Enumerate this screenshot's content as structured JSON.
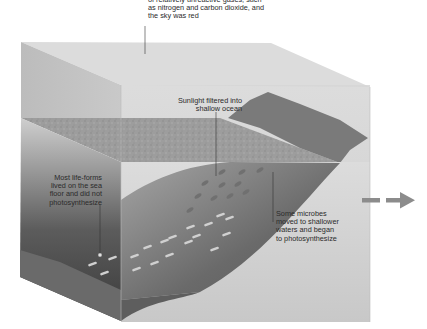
{
  "diagram": {
    "labels": {
      "atmosphere": "of relatively unreactive gases, such\nas nitrogen and carbon dioxide, and\nthe sky was red",
      "atmosphere_cropped_first_line": "Early atmosphere was composed",
      "sunlight": "Sunlight filtered into\nshallow ocean",
      "sea_floor": "Most life-forms\nlived on the sea\nfloor and did not\nphotosynthesize",
      "shallow_microbes": "Some microbes\nmoved to shallower\nwaters and began\nto photosynthesize"
    },
    "regions": [
      {
        "name": "atmosphere",
        "color": "#d9d9d9"
      },
      {
        "name": "water-surface",
        "color": "#9a9a9a"
      },
      {
        "name": "land",
        "color": "#7c7c7c"
      },
      {
        "name": "deep-ocean-left-face",
        "color": "#5e5e5e"
      },
      {
        "name": "sea-floor-slope",
        "color": "#6f6f6f"
      },
      {
        "name": "shallow-water-front-face",
        "color": "#c4c4c4"
      }
    ],
    "next_arrow": {
      "direction": "right",
      "style": "dashed",
      "color": "#8c8c8c"
    }
  }
}
